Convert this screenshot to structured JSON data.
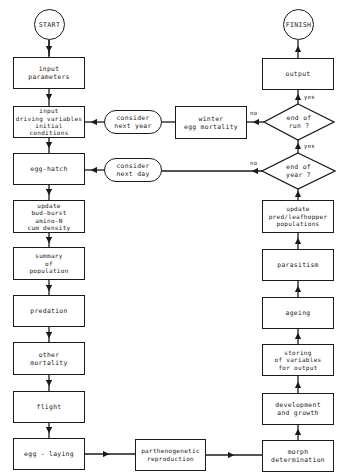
{
  "header": {
    "text": ""
  },
  "flowchart": {
    "start": "START",
    "finish": "FINISH",
    "left_column": [
      {
        "id": "input-parameters",
        "lines": [
          "input",
          "parameters"
        ]
      },
      {
        "id": "input-driving",
        "lines": [
          "input",
          "driving variables",
          "initial conditions"
        ]
      },
      {
        "id": "egg-hatch",
        "lines": [
          "egg-hatch"
        ]
      },
      {
        "id": "update-bud-burst",
        "lines": [
          "update",
          "bud-burst",
          "amino-N",
          "cum density"
        ]
      },
      {
        "id": "summary-population",
        "lines": [
          "summary",
          "of",
          "population"
        ]
      },
      {
        "id": "predation",
        "lines": [
          "predation"
        ]
      },
      {
        "id": "other-mortality",
        "lines": [
          "other",
          "mortality"
        ]
      },
      {
        "id": "flight",
        "lines": [
          "flight"
        ]
      },
      {
        "id": "egg-laying",
        "lines": [
          "egg - laying"
        ]
      }
    ],
    "middle": [
      {
        "id": "consider-next-year",
        "lines": [
          "consider",
          "next year"
        ]
      },
      {
        "id": "winter-egg-mortality",
        "lines": [
          "winter",
          "egg mortality"
        ]
      },
      {
        "id": "consider-next-day",
        "lines": [
          "consider",
          "next day"
        ]
      },
      {
        "id": "parthenogenetic",
        "lines": [
          "parthenogenetic",
          "reproduction"
        ]
      }
    ],
    "right_column": [
      {
        "id": "output",
        "lines": [
          "output"
        ]
      },
      {
        "id": "end-of-run",
        "lines": [
          "end of",
          "run ?"
        ]
      },
      {
        "id": "end-of-year",
        "lines": [
          "end of",
          "year ?"
        ]
      },
      {
        "id": "update-pred",
        "lines": [
          "update",
          "pred/leafhopper",
          "populations"
        ]
      },
      {
        "id": "parasitism",
        "lines": [
          "parasitism"
        ]
      },
      {
        "id": "ageing",
        "lines": [
          "ageing"
        ]
      },
      {
        "id": "storing",
        "lines": [
          "storing",
          "of variables",
          "for output"
        ]
      },
      {
        "id": "development",
        "lines": [
          "development",
          "and growth"
        ]
      },
      {
        "id": "morph",
        "lines": [
          "morph",
          "determination"
        ]
      }
    ],
    "edge_labels": {
      "yes": "yes",
      "no": "no"
    }
  }
}
